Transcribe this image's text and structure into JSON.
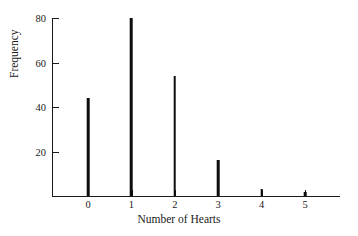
{
  "chart_data": {
    "type": "bar",
    "title": "",
    "xlabel": "Number of Hearts",
    "ylabel": "Frequency",
    "categories": [
      "0",
      "1",
      "2",
      "3",
      "4",
      "5"
    ],
    "values": [
      44,
      80,
      54,
      16,
      3,
      2
    ],
    "xlim": [
      -0.85,
      5.8
    ],
    "ylim": [
      0,
      80
    ],
    "yticks": [
      20,
      40,
      60,
      80
    ],
    "ytick_labels": [
      "20",
      "40",
      "60",
      "80"
    ],
    "xticks": [
      0,
      1,
      2,
      3,
      4,
      5
    ],
    "xtick_labels": [
      "0",
      "1",
      "2",
      "3",
      "4",
      "5"
    ],
    "grid": false,
    "legend": false,
    "bar_color": "#0d0d0d",
    "axis_color": "#1a1a1a",
    "background_color": "#ffffff",
    "bar_style": "thin-spike"
  }
}
